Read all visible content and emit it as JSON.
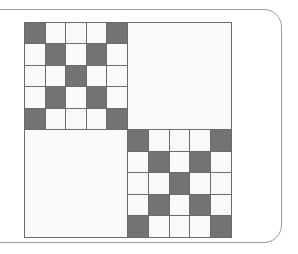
{
  "figure": {
    "frame_label": "rounded card frame"
  },
  "colors": {
    "filled_cell": "#737373",
    "empty_cell": "#fafafa",
    "grid_line": "#6b6b6b",
    "block_divider": "#6b6b6b",
    "matrix_border": "#6b6b6b",
    "frame_border": "#9a9a9a",
    "page_background": "#ffffff"
  },
  "chart_data": {
    "type": "heatmap",
    "xlabel": "",
    "ylabel": "",
    "rows": 10,
    "cols": 10,
    "block_rows": 2,
    "block_cols": 2,
    "block_size": 5,
    "value_legend": {
      "0": "empty cell",
      "1": "filled cell"
    },
    "block_structure": [
      [
        "patterned",
        "empty"
      ],
      [
        "empty",
        "patterned"
      ]
    ],
    "block_pattern_name": "x-shape",
    "block_pattern": [
      [
        1,
        0,
        0,
        0,
        1
      ],
      [
        0,
        1,
        0,
        1,
        0
      ],
      [
        0,
        0,
        1,
        0,
        0
      ],
      [
        0,
        1,
        0,
        1,
        0
      ],
      [
        1,
        0,
        0,
        0,
        1
      ]
    ],
    "blocks": [
      {
        "name": "top-left-block",
        "position": "top-left",
        "kind": "patterned",
        "filled_count": 9,
        "values": [
          [
            1,
            0,
            0,
            0,
            1
          ],
          [
            0,
            1,
            0,
            1,
            0
          ],
          [
            0,
            0,
            1,
            0,
            0
          ],
          [
            0,
            1,
            0,
            1,
            0
          ],
          [
            1,
            0,
            0,
            0,
            1
          ]
        ]
      },
      {
        "name": "top-right-block",
        "position": "top-right",
        "kind": "empty",
        "filled_count": 0,
        "values": [
          [
            0,
            0,
            0,
            0,
            0
          ],
          [
            0,
            0,
            0,
            0,
            0
          ],
          [
            0,
            0,
            0,
            0,
            0
          ],
          [
            0,
            0,
            0,
            0,
            0
          ],
          [
            0,
            0,
            0,
            0,
            0
          ]
        ]
      },
      {
        "name": "bottom-left-block",
        "position": "bottom-left",
        "kind": "empty",
        "filled_count": 0,
        "values": [
          [
            0,
            0,
            0,
            0,
            0
          ],
          [
            0,
            0,
            0,
            0,
            0
          ],
          [
            0,
            0,
            0,
            0,
            0
          ],
          [
            0,
            0,
            0,
            0,
            0
          ],
          [
            0,
            0,
            0,
            0,
            0
          ]
        ]
      },
      {
        "name": "bottom-right-block",
        "position": "bottom-right",
        "kind": "patterned",
        "filled_count": 9,
        "values": [
          [
            1,
            0,
            0,
            0,
            1
          ],
          [
            0,
            1,
            0,
            1,
            0
          ],
          [
            0,
            0,
            1,
            0,
            0
          ],
          [
            0,
            1,
            0,
            1,
            0
          ],
          [
            1,
            0,
            0,
            0,
            1
          ]
        ]
      }
    ],
    "matrix_values": [
      [
        1,
        0,
        0,
        0,
        1,
        0,
        0,
        0,
        0,
        0
      ],
      [
        0,
        1,
        0,
        1,
        0,
        0,
        0,
        0,
        0,
        0
      ],
      [
        0,
        0,
        1,
        0,
        0,
        0,
        0,
        0,
        0,
        0
      ],
      [
        0,
        1,
        0,
        1,
        0,
        0,
        0,
        0,
        0,
        0
      ],
      [
        1,
        0,
        0,
        0,
        1,
        0,
        0,
        0,
        0,
        0
      ],
      [
        0,
        0,
        0,
        0,
        0,
        1,
        0,
        0,
        0,
        1
      ],
      [
        0,
        0,
        0,
        0,
        0,
        0,
        1,
        0,
        1,
        0
      ],
      [
        0,
        0,
        0,
        0,
        0,
        0,
        0,
        1,
        0,
        0
      ],
      [
        0,
        0,
        0,
        0,
        0,
        0,
        1,
        0,
        1,
        0
      ],
      [
        0,
        0,
        0,
        0,
        0,
        1,
        0,
        0,
        0,
        1
      ]
    ],
    "total_filled": 18,
    "total_cells": 100,
    "grid": true,
    "legend": "none"
  }
}
